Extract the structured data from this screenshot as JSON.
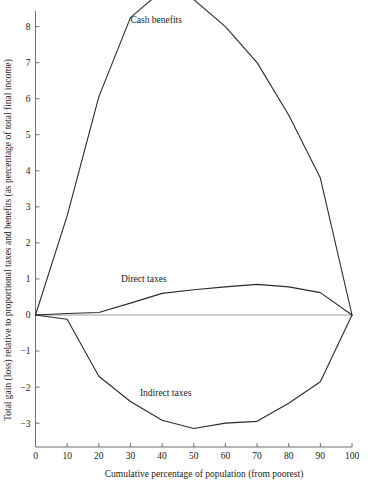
{
  "chart_data": {
    "type": "line",
    "title": "",
    "xlabel": "Cumulative percentage of population (from poorest)",
    "ylabel": "Total gain (loss) relative to proportional taxes and benefits (as percentage of total final income)",
    "xlim": [
      0,
      100
    ],
    "ylim": [
      -3.5,
      9.2
    ],
    "grid": false,
    "legend_position": "inline-annotations",
    "x_ticks": [
      0,
      10,
      20,
      30,
      40,
      50,
      60,
      70,
      80,
      90,
      100
    ],
    "x_tick_labels": [
      "0",
      "10",
      "20",
      "30",
      "40",
      "50",
      "60",
      "70",
      "80",
      "90",
      "100"
    ],
    "y_ticks": [
      -3,
      -2,
      -1,
      0,
      1,
      2,
      3,
      4,
      5,
      6,
      7,
      8,
      9
    ],
    "y_tick_labels": [
      "−3",
      "−2",
      "−1",
      "0",
      "1",
      "2",
      "3",
      "4",
      "5",
      "6",
      "7",
      "8",
      "9"
    ],
    "x": [
      0,
      10,
      20,
      30,
      40,
      50,
      60,
      70,
      80,
      90,
      100
    ],
    "series": [
      {
        "name": "Cash benefits",
        "label_x": 30,
        "label_y": 8.1,
        "values": [
          0,
          2.75,
          6.05,
          8.25,
          9.0,
          8.75,
          8.0,
          7.0,
          5.55,
          3.8,
          0
        ]
      },
      {
        "name": "Direct taxes",
        "label_x": 27,
        "label_y": 0.92,
        "values": [
          0,
          0.04,
          0.07,
          0.33,
          0.6,
          0.7,
          0.78,
          0.85,
          0.78,
          0.62,
          0
        ]
      },
      {
        "name": "Indirect taxes",
        "label_x": 33,
        "label_y": -2.24,
        "values": [
          0,
          -0.12,
          -1.7,
          -2.4,
          -2.92,
          -3.15,
          -3.0,
          -2.95,
          -2.45,
          -1.85,
          0
        ]
      }
    ],
    "colors": {
      "line": "#2b2b2b",
      "axis": "#6f6f6f",
      "zero_line": "#9a9a9a",
      "background": "#ffffff",
      "text": "#1a1a1a"
    }
  }
}
